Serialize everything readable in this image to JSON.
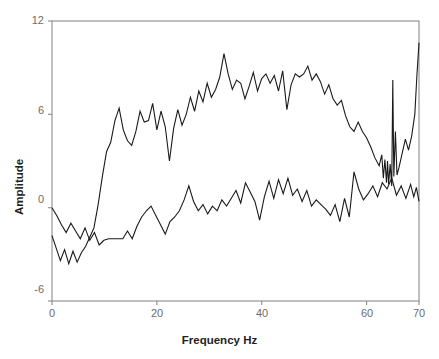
{
  "chart_data": {
    "type": "line",
    "title": "",
    "subtitle": "",
    "xlabel": "Frequency Hz",
    "ylabel": "Amplitude",
    "xlim": [
      0,
      70
    ],
    "ylim": [
      -6,
      12
    ],
    "xticks": [
      0,
      20,
      40,
      60,
      70
    ],
    "yticks": [
      -6,
      0,
      6,
      12
    ],
    "xticklabels": [
      "0",
      "20",
      "40",
      "60",
      "70"
    ],
    "yticklabels": [
      "-6",
      "0",
      "6",
      "12"
    ],
    "grid": false,
    "legend": "none",
    "frame": "box",
    "line_color": "#1a1a1a",
    "axis_color": "#939598",
    "tick_label_color": "#6c6c6c",
    "axis_title_color": "#231f20",
    "background": "#ffffff",
    "series": [
      {
        "name": "upper-curve",
        "x": [
          0.0,
          0.8,
          1.6,
          2.4,
          3.2,
          4.0,
          4.8,
          5.6,
          6.4,
          7.2,
          8.0,
          8.8,
          9.6,
          10.4,
          11.2,
          12.0,
          12.8,
          13.6,
          14.4,
          15.2,
          16.0,
          16.8,
          17.6,
          18.4,
          19.2,
          20.0,
          20.8,
          21.6,
          22.4,
          23.2,
          24.0,
          24.8,
          25.6,
          26.4,
          27.2,
          28.0,
          28.8,
          29.6,
          30.4,
          31.2,
          32.0,
          32.8,
          33.6,
          34.4,
          35.2,
          36.0,
          36.8,
          37.6,
          38.4,
          39.2,
          40.0,
          40.8,
          41.6,
          42.4,
          43.2,
          44.0,
          44.8,
          45.6,
          46.4,
          47.2,
          48.0,
          48.8,
          49.6,
          50.4,
          51.2,
          52.0,
          52.8,
          53.6,
          54.4,
          55.2,
          56.0,
          56.8,
          57.6,
          58.4,
          59.2,
          60.0,
          60.8,
          61.6,
          62.4,
          62.9,
          63.2,
          63.5,
          63.8,
          64.0,
          64.2,
          64.5,
          64.8,
          65.0,
          65.2,
          65.5,
          65.8,
          66.2,
          66.8,
          67.4,
          68.0,
          68.6,
          69.2,
          69.6,
          70.0
        ],
        "y": [
          -1.8,
          -2.6,
          -3.4,
          -2.7,
          -3.6,
          -2.8,
          -3.5,
          -2.9,
          -2.5,
          -1.9,
          -1.3,
          0.2,
          2.0,
          3.6,
          4.2,
          5.6,
          6.4,
          5.0,
          4.3,
          4.0,
          4.9,
          6.2,
          5.5,
          5.6,
          6.7,
          5.0,
          6.2,
          5.2,
          3.0,
          5.1,
          6.3,
          5.3,
          6.0,
          7.1,
          6.2,
          7.5,
          6.8,
          8.0,
          7.1,
          7.6,
          8.4,
          9.9,
          8.6,
          7.6,
          8.2,
          8.0,
          7.0,
          7.8,
          8.7,
          7.5,
          8.3,
          8.6,
          8.0,
          8.5,
          7.5,
          8.8,
          6.3,
          7.9,
          8.6,
          8.4,
          8.6,
          9.1,
          8.2,
          8.6,
          8.1,
          7.3,
          7.9,
          7.0,
          6.6,
          6.9,
          5.9,
          5.2,
          4.9,
          5.5,
          4.9,
          4.5,
          3.9,
          3.2,
          2.7,
          3.4,
          1.9,
          3.1,
          1.6,
          3.0,
          1.5,
          2.8,
          1.4,
          8.2,
          2.0,
          4.9,
          2.1,
          2.6,
          3.5,
          4.4,
          3.7,
          4.6,
          6.0,
          8.5,
          10.6
        ]
      },
      {
        "name": "lower-curve",
        "x": [
          0.0,
          0.9,
          1.8,
          2.7,
          3.6,
          4.5,
          5.4,
          6.3,
          7.2,
          8.1,
          9.0,
          9.9,
          10.8,
          11.7,
          12.6,
          13.5,
          14.4,
          15.3,
          16.2,
          17.1,
          18.0,
          18.9,
          19.8,
          20.7,
          21.6,
          22.5,
          23.4,
          24.3,
          25.2,
          26.1,
          27.0,
          27.9,
          28.8,
          29.7,
          30.6,
          31.5,
          32.4,
          33.3,
          34.2,
          35.1,
          36.0,
          36.9,
          37.8,
          38.7,
          39.6,
          40.5,
          41.4,
          42.3,
          43.2,
          44.1,
          45.0,
          45.9,
          46.8,
          47.7,
          48.6,
          49.5,
          50.4,
          51.3,
          52.2,
          53.1,
          54.0,
          54.9,
          55.8,
          56.7,
          57.6,
          58.5,
          59.4,
          60.3,
          61.2,
          62.1,
          63.0,
          63.9,
          64.8,
          65.7,
          66.6,
          67.5,
          68.4,
          69.0,
          69.5,
          70.0
        ],
        "y": [
          0.0,
          -0.5,
          -1.1,
          -1.6,
          -1.0,
          -1.5,
          -2.0,
          -1.3,
          -2.1,
          -1.6,
          -2.4,
          -2.1,
          -2.0,
          -2.0,
          -2.0,
          -2.0,
          -1.5,
          -2.0,
          -1.2,
          -0.6,
          -0.2,
          0.1,
          -0.5,
          -1.1,
          -1.7,
          -0.9,
          -0.6,
          -0.2,
          0.5,
          1.4,
          0.4,
          -0.2,
          0.2,
          -0.4,
          0.1,
          -0.2,
          0.5,
          0.1,
          0.6,
          1.1,
          0.3,
          1.6,
          1.0,
          0.4,
          -0.8,
          0.7,
          1.7,
          0.6,
          1.8,
          0.9,
          1.9,
          0.8,
          1.2,
          0.4,
          1.1,
          0.1,
          0.5,
          0.2,
          -0.1,
          -0.5,
          0.2,
          -0.9,
          0.6,
          -0.6,
          2.3,
          1.2,
          0.5,
          0.9,
          1.4,
          0.7,
          1.6,
          1.2,
          1.9,
          0.8,
          1.4,
          0.6,
          1.5,
          0.7,
          1.3,
          0.4
        ]
      }
    ]
  }
}
